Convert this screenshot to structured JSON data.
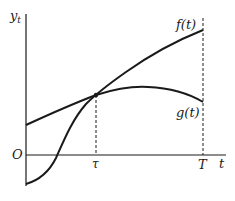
{
  "diagram": {
    "type": "function-plot",
    "axes": {
      "y_label": "y",
      "y_label_subscript": "t",
      "x_label": "t",
      "origin_label": "O"
    },
    "x_ticks": [
      {
        "label": "τ",
        "x": 96
      },
      {
        "label": "T",
        "x": 203
      }
    ],
    "curves": [
      {
        "name": "f",
        "label": "f(t)",
        "description": "S-shaped increasing curve starting below origin, crossing g at τ, ending high at T"
      },
      {
        "name": "g",
        "label": "g(t)",
        "description": "concave curve starting above origin, crossing f at τ, peaking after τ, declining toward T"
      }
    ],
    "annotations": {
      "intersection_label": "τ",
      "end_label": "T"
    },
    "colors": {
      "line": "#1a1a1a",
      "background": "#ffffff"
    }
  }
}
